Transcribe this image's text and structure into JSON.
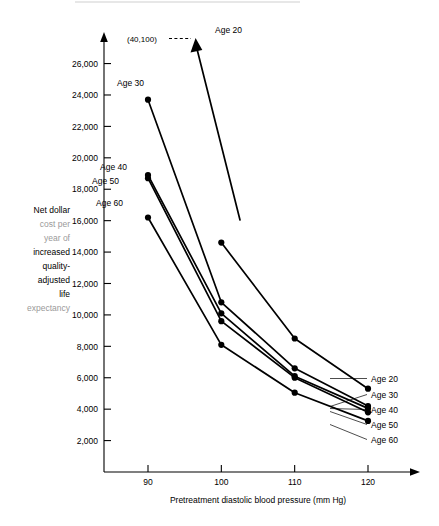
{
  "chart_data": {
    "type": "line",
    "title": "",
    "xlabel": "Pretreatment diastolic blood pressure (mm Hg)",
    "ylabel": "Net dollar cost per year of increased quality-adjusted life expectancy",
    "ylabel_lines": [
      "Net dollar",
      "cost per",
      "year of",
      "increased",
      "quality-",
      "adjusted",
      "life",
      "expectancy"
    ],
    "x": [
      90,
      100,
      110,
      120
    ],
    "xlim": [
      84,
      126
    ],
    "ylim": [
      0,
      27500
    ],
    "xticks": [
      "90",
      "100",
      "110",
      "120"
    ],
    "yticks": [
      "2,000",
      "4,000",
      "6,000",
      "8,000",
      "10,000",
      "12,000",
      "14,000",
      "16,000",
      "18,000",
      "20,000",
      "22,000",
      "24,000",
      "26,000"
    ],
    "ytick_values": [
      2000,
      4000,
      6000,
      8000,
      10000,
      12000,
      14000,
      16000,
      18000,
      20000,
      22000,
      24000,
      26000
    ],
    "grid": false,
    "legend_position": "right",
    "series": [
      {
        "name": "Age 20",
        "label": "Age 20",
        "values": [
          null,
          14600,
          8500,
          5300
        ],
        "off_scale_at_90": true,
        "arrow_note": "line continues above chart top at 90 mm Hg"
      },
      {
        "name": "Age 30",
        "label": "Age 30",
        "values": [
          23700,
          10800,
          6600,
          4200
        ]
      },
      {
        "name": "Age 40",
        "label": "Age 40",
        "values": [
          18900,
          10100,
          6100,
          4050
        ]
      },
      {
        "name": "Age 50",
        "label": "Age 50",
        "values": [
          18700,
          9600,
          6000,
          3800
        ]
      },
      {
        "name": "Age 60",
        "label": "Age 60",
        "values": [
          16200,
          8100,
          5050,
          3250
        ]
      }
    ],
    "annotations": [
      {
        "text": "(40,100)",
        "note": "dashed leader to Age 20 arrow tip"
      },
      {
        "text": "Age 20",
        "note": "inline label at top of Age 20 arrow"
      },
      {
        "text": "Age 30",
        "note": "inline label at 90 mm Hg point"
      },
      {
        "text": "Age 40",
        "note": "inline label at 90 mm Hg point"
      },
      {
        "text": "Age 50",
        "note": "inline label at 90 mm Hg point"
      },
      {
        "text": "Age 60",
        "note": "inline label at 90 mm Hg point"
      }
    ],
    "right_labels": [
      "Age 20",
      "Age 30",
      "Age 40",
      "Age 50",
      "Age 60"
    ]
  },
  "colors": {
    "ink": "#000000",
    "background": "#ffffff",
    "faded_text": "#9a9a9a"
  }
}
